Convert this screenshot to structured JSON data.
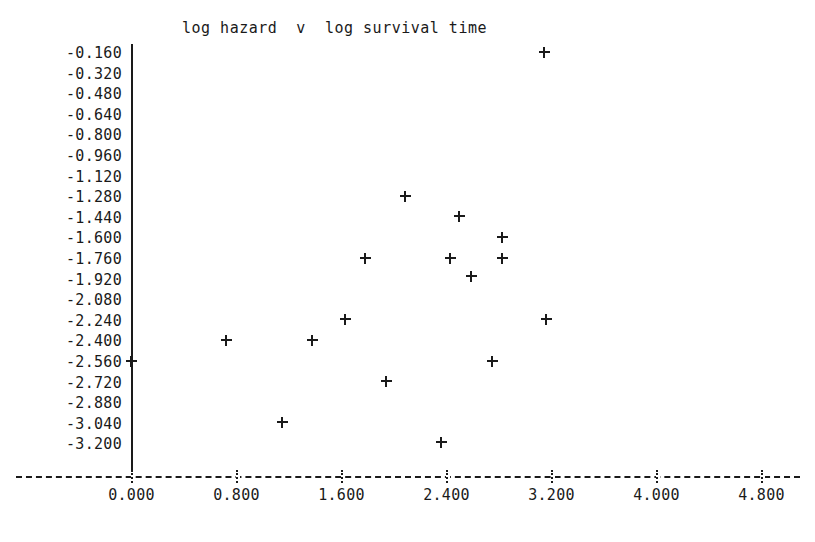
{
  "chart_data": {
    "type": "scatter",
    "title": "log hazard  v  log survival time",
    "xlabel": "",
    "ylabel": "",
    "xlim": [
      -0.45,
      5.05
    ],
    "ylim": [
      -3.33,
      -0.11
    ],
    "grid": false,
    "legend": null,
    "marker": "+",
    "xticks": [
      "0.000",
      "0.800",
      "1.600",
      "2.400",
      "3.200",
      "4.000",
      "4.800"
    ],
    "xtick_values": [
      0.0,
      0.8,
      1.6,
      2.4,
      3.2,
      4.0,
      4.8
    ],
    "yticks": [
      "-0.160",
      "-0.320",
      "-0.480",
      "-0.640",
      "-0.800",
      "-0.960",
      "-1.120",
      "-1.280",
      "-1.440",
      "-1.600",
      "-1.760",
      "-1.920",
      "-2.080",
      "-2.240",
      "-2.400",
      "-2.560",
      "-2.720",
      "-2.880",
      "-3.040",
      "-3.200"
    ],
    "ytick_values": [
      -0.16,
      -0.32,
      -0.48,
      -0.64,
      -0.8,
      -0.96,
      -1.12,
      -1.28,
      -1.44,
      -1.6,
      -1.76,
      -1.92,
      -2.08,
      -2.24,
      -2.4,
      -2.56,
      -2.72,
      -2.88,
      -3.04,
      -3.2
    ],
    "points": [
      {
        "x": 3.15,
        "y": -0.16
      },
      {
        "x": 2.09,
        "y": -1.285
      },
      {
        "x": 2.5,
        "y": -1.44
      },
      {
        "x": 2.83,
        "y": -1.6
      },
      {
        "x": 1.78,
        "y": -1.76
      },
      {
        "x": 2.43,
        "y": -1.76
      },
      {
        "x": 2.83,
        "y": -1.76
      },
      {
        "x": 2.59,
        "y": -1.9
      },
      {
        "x": 1.63,
        "y": -2.24
      },
      {
        "x": 3.16,
        "y": -2.24
      },
      {
        "x": 0.72,
        "y": -2.4
      },
      {
        "x": 1.38,
        "y": -2.4
      },
      {
        "x": 2.75,
        "y": -2.56
      },
      {
        "x": 0.0,
        "y": -2.56
      },
      {
        "x": 1.94,
        "y": -2.72
      },
      {
        "x": 1.15,
        "y": -3.04
      },
      {
        "x": 2.36,
        "y": -3.195
      }
    ]
  }
}
